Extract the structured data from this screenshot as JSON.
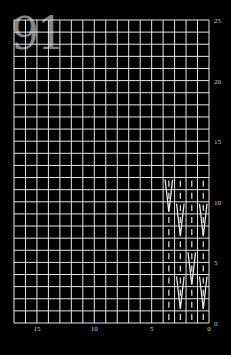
{
  "chart_number": "91",
  "grid": {
    "columns": 17,
    "rows": 25,
    "left": 14,
    "top": 20,
    "right": 209,
    "bottom": 323,
    "line_color": "#e6e6e6",
    "background": "#000000"
  },
  "x_axis": {
    "labels": [
      "15",
      "10",
      "5",
      "0"
    ],
    "values": [
      15,
      10,
      5,
      0
    ],
    "direction": "right-to-left"
  },
  "y_axis": {
    "labels": [
      "0",
      "5",
      "10",
      "15",
      "20",
      "25"
    ],
    "values": [
      0,
      5,
      10,
      15,
      20,
      25
    ],
    "side": "right"
  },
  "pattern": {
    "columns": 4,
    "rows": 12,
    "stitch_color": "#e6e6e6",
    "knit_symbol": "|",
    "cells": [
      [
        1,
        1,
        1,
        1
      ],
      [
        1,
        1,
        1,
        1
      ],
      [
        1,
        1,
        1,
        1
      ],
      [
        1,
        1,
        1,
        1
      ],
      [
        1,
        1,
        1,
        1
      ],
      [
        1,
        1,
        1,
        1
      ],
      [
        1,
        1,
        1,
        1
      ],
      [
        1,
        1,
        1,
        1
      ],
      [
        1,
        1,
        1,
        1
      ],
      [
        1,
        1,
        1,
        1
      ],
      [
        1,
        1,
        1,
        1
      ],
      [
        1,
        1,
        1,
        1
      ]
    ],
    "v_strokes": [
      {
        "col": 3,
        "row_top": 12,
        "row_bottom": 9
      },
      {
        "col": 2,
        "row_top": 10,
        "row_bottom": 7
      },
      {
        "col": 0,
        "row_top": 10,
        "row_bottom": 7
      },
      {
        "col": 1,
        "row_top": 6,
        "row_bottom": 3
      },
      {
        "col": 2,
        "row_top": 4,
        "row_bottom": 1
      },
      {
        "col": 0,
        "row_top": 4,
        "row_bottom": 1
      }
    ]
  }
}
